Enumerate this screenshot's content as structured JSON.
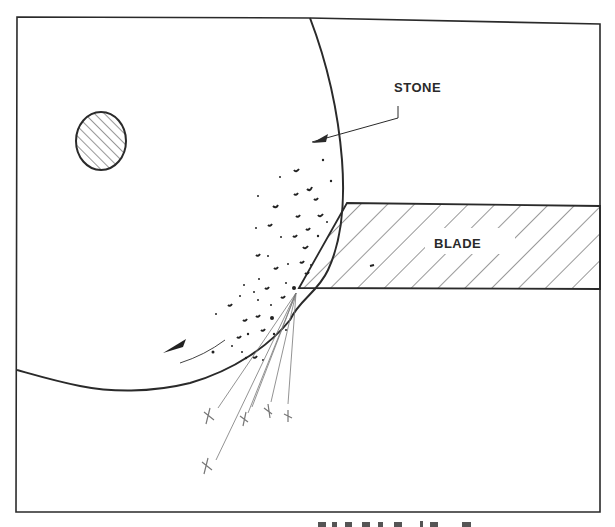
{
  "diagram": {
    "labels": {
      "stone": "STONE",
      "blade": "BLADE"
    },
    "caption_partial": "",
    "colors": {
      "line": "#2a2a2a",
      "hatch": "#333333",
      "background": "#ffffff",
      "spark": "#666666"
    },
    "elements": {
      "frame": "rectangular border",
      "stone": "large grinding wheel (partial circle)",
      "axle": "hatched circular hub",
      "blade": "hatched blade with bevelled edge",
      "grit_particles": "abrasive particles near contact area",
      "rotation_arrow": "counter-clockwise rotation direction",
      "sparks": "spark trails with X marks"
    }
  }
}
